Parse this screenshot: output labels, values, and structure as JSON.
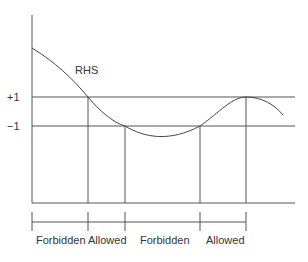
{
  "diagram": {
    "curve_label": "RHS",
    "levels": [
      {
        "label": "+1",
        "y": 97
      },
      {
        "label": "−1",
        "y": 126
      }
    ],
    "regions": [
      {
        "label": "Forbidden",
        "x_start": 32,
        "x_end": 88
      },
      {
        "label": "Allowed",
        "x_start": 88,
        "x_end": 125
      },
      {
        "label": "Forbidden",
        "x_start": 125,
        "x_end": 200
      },
      {
        "label": "Allowed",
        "x_start": 200,
        "x_end": 246
      }
    ],
    "line_color": "#555555"
  }
}
